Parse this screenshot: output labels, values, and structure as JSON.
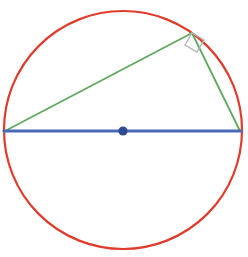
{
  "figure": {
    "width": 248,
    "height": 257,
    "background_color": "#ffffff"
  },
  "colors": {
    "circle_stroke": "#e03c2c",
    "diameter_stroke": "#4a6ab5",
    "triangle_stroke": "#5fa85f",
    "center_point_fill": "#2f4b96",
    "right_angle_stroke": "#b4b4b4"
  },
  "chart_data": {
    "type": "diagram",
    "circle": {
      "center_x": 123,
      "center_y": 130,
      "radius": 119,
      "stroke_width": 2.2,
      "color": "#e03c2c"
    },
    "diameter": {
      "label": "diameter",
      "x1": 4,
      "y1": 131,
      "x2": 241,
      "y2": 131,
      "stroke_width": 3.2,
      "color": "#4a6ab5"
    },
    "center_point": {
      "x": 123,
      "y": 131,
      "radius": 4.6,
      "color": "#2f4b96"
    },
    "triangle": {
      "label": "inscribed right triangle",
      "vertices": [
        {
          "name": "left-vertex",
          "x": 5,
          "y": 131
        },
        {
          "name": "apex-vertex",
          "x": 192,
          "y": 33
        },
        {
          "name": "right-vertex",
          "x": 240,
          "y": 131
        }
      ],
      "legs": [
        {
          "name": "hypotenuse-leg-left",
          "x1": 5,
          "y1": 131,
          "x2": 192,
          "y2": 33
        },
        {
          "name": "leg-right",
          "x1": 192,
          "y1": 33,
          "x2": 240,
          "y2": 131
        }
      ],
      "stroke_width": 1.8,
      "color": "#5fa85f"
    },
    "right_angle_marker": {
      "label": "right angle",
      "vertex_x": 192,
      "vertex_y": 33,
      "points": "192,33 204,40 197,52 185,45",
      "stroke_width": 1.4,
      "color": "#b4b4b4"
    }
  }
}
